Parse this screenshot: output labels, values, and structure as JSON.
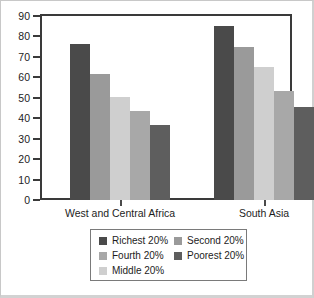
{
  "chart_data": {
    "type": "bar",
    "title": "",
    "subtitle": "",
    "xlabel": "",
    "ylabel": "",
    "ylim": [
      0,
      90
    ],
    "yticks": [
      0,
      10,
      20,
      30,
      40,
      50,
      60,
      70,
      80,
      90
    ],
    "ytick_labels": [
      "0",
      "10",
      "20",
      "30",
      "40",
      "50",
      "60",
      "70",
      "80",
      "90"
    ],
    "grid": false,
    "legend_position": "bottom",
    "categories": [
      "West and Central Africa",
      "South Asia"
    ],
    "series": [
      {
        "name": "Richest 20%",
        "color": "#4a4a4a",
        "values": [
          76.5,
          85.0
        ]
      },
      {
        "name": "Second 20%",
        "color": "#9a9a9a",
        "values": [
          61.5,
          75.0
        ]
      },
      {
        "name": "Middle 20%",
        "color": "#cfcfcf",
        "values": [
          50.5,
          65.0
        ]
      },
      {
        "name": "Fourth 20%",
        "color": "#a8a8a8",
        "values": [
          43.5,
          53.5
        ]
      },
      {
        "name": "Poorest 20%",
        "color": "#5e5e5e",
        "values": [
          36.5,
          45.5
        ]
      }
    ]
  },
  "legend": {
    "entries": [
      {
        "label": "Richest 20%",
        "color": "#4a4a4a",
        "col": 0,
        "row": 0
      },
      {
        "label": "Second 20%",
        "color": "#9a9a9a",
        "col": 1,
        "row": 0
      },
      {
        "label": "Fourth 20%",
        "color": "#a8a8a8",
        "col": 0,
        "row": 1
      },
      {
        "label": "Poorest 20%",
        "color": "#5e5e5e",
        "col": 1,
        "row": 1
      },
      {
        "label": "Middle 20%",
        "color": "#cfcfcf",
        "col": 0,
        "row": 2
      }
    ]
  },
  "colors": {
    "frame": "#3a3a3a",
    "outer_border": "#c8c8c8",
    "text": "#1d1d1d",
    "legend_border": "#7a7a7a",
    "background": "#ffffff"
  }
}
